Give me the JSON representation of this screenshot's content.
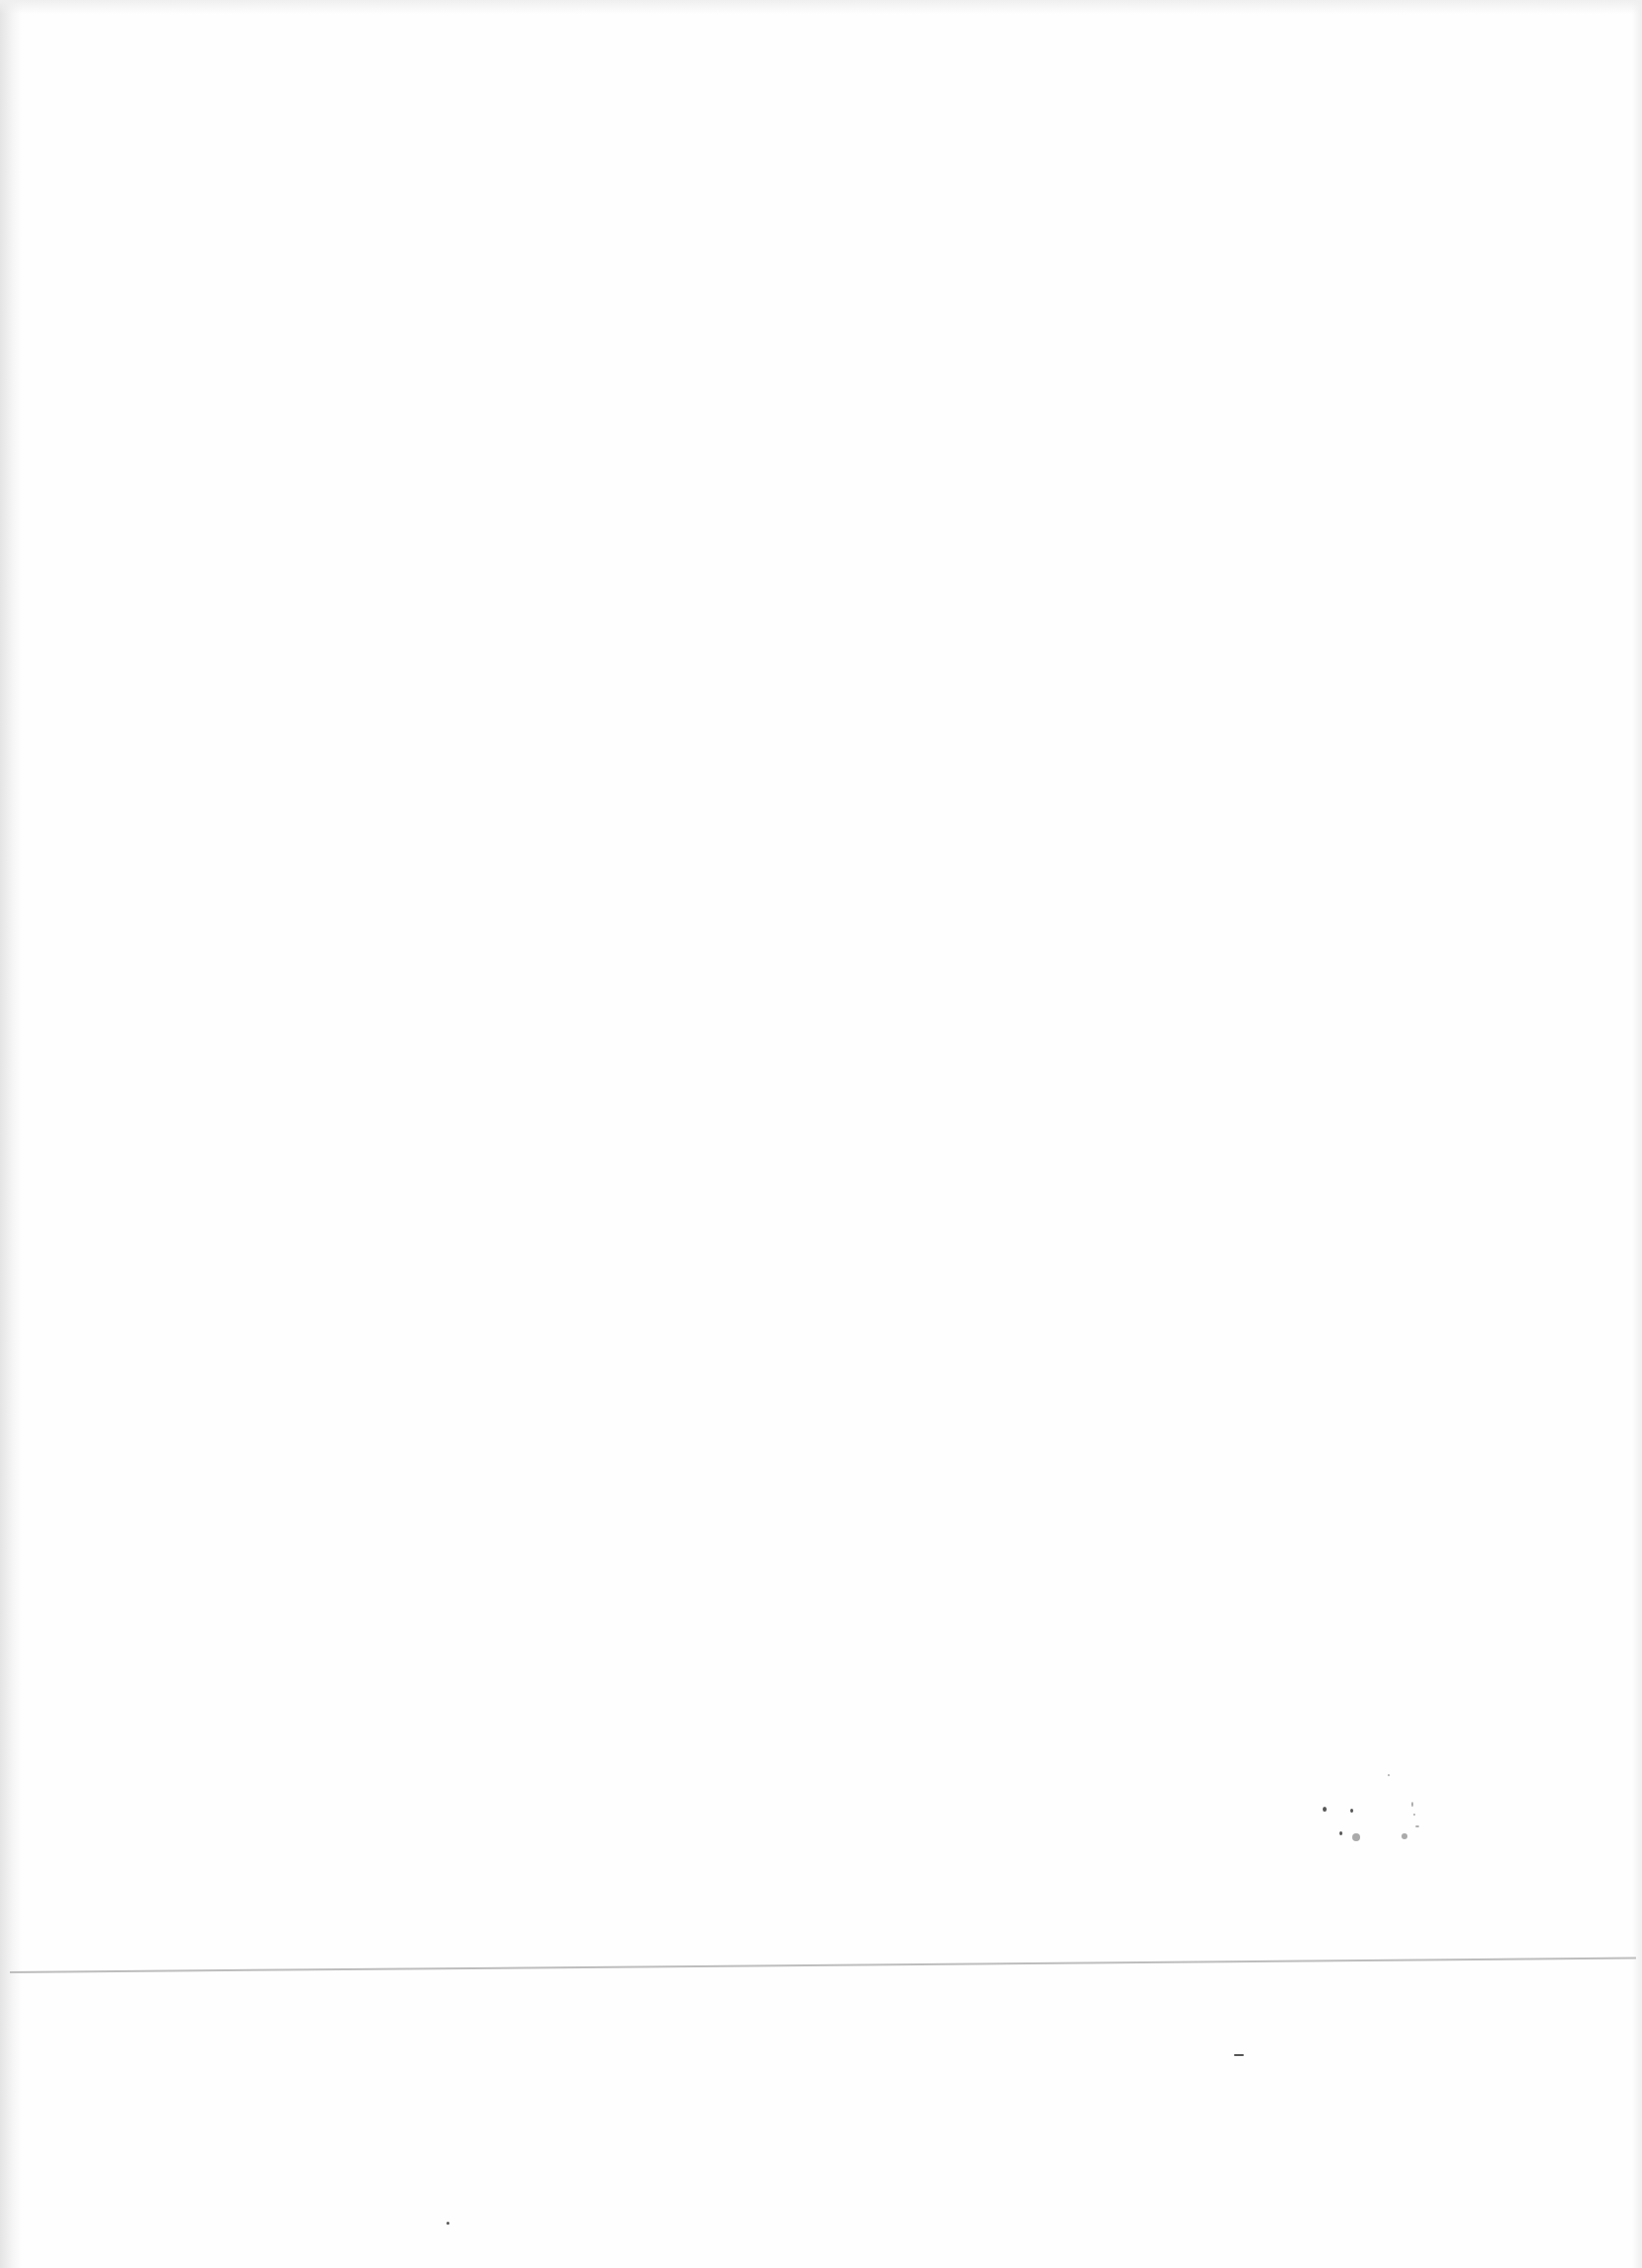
{
  "document": {
    "type": "scanned-page",
    "content": "blank",
    "text": "",
    "colors": {
      "paper": "#fefefe",
      "fold_line": "#bdbdbd",
      "edge_shadow": "#e4e4e4"
    }
  }
}
